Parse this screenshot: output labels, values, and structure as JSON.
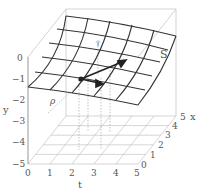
{
  "figure": {
    "type": "3d-surface-diagram",
    "surface_label": "S",
    "point_label": "ρ",
    "small_label": "T",
    "axes": {
      "y": {
        "label": "y",
        "ticks": [
          "0",
          "−1",
          "−2",
          "−3",
          "−4",
          "−5"
        ]
      },
      "t": {
        "label": "t",
        "ticks": [
          "0",
          "1",
          "2",
          "3",
          "4",
          "5"
        ]
      },
      "x": {
        "label": "x",
        "ticks": [
          "0",
          "1",
          "2",
          "3",
          "4",
          "5"
        ]
      }
    },
    "colors": {
      "surface_grid": "#333333",
      "box": "#c8c8c8",
      "floor_grid": "#bbbbbb",
      "arrow": "#222222",
      "text": "#555555"
    }
  }
}
